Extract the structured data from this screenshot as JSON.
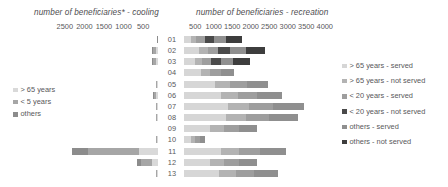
{
  "titles": {
    "cooling": "number of beneficiaries* - cooling",
    "recreation": "number of beneficiaries - recreation"
  },
  "axes": {
    "cooling_ticks": [
      "2500",
      "2000",
      "1500",
      "1000",
      "500"
    ],
    "recreation_ticks": [
      "500",
      "1000",
      "1500",
      "2000",
      "2500",
      "3000",
      "3500",
      "4000"
    ]
  },
  "legend_left": {
    "items": [
      {
        "label": "> 65 years",
        "color": "#d9d9d9"
      },
      {
        "label": "< 5 years",
        "color": "#a6a6a6"
      },
      {
        "label": "others",
        "color": "#8c8c8c"
      }
    ]
  },
  "legend_right": {
    "items": [
      {
        "label": "> 65 years - served",
        "color": "#d6d6d6"
      },
      {
        "label": "> 65 years - not served",
        "color": "#b3b3b3"
      },
      {
        "label": "< 20 years - served",
        "color": "#9e9e9e"
      },
      {
        "label": "< 20 years - not served",
        "color": "#4a4a4a"
      },
      {
        "label": "others - served",
        "color": "#8f8f8f"
      },
      {
        "label": "others - not served",
        "color": "#3d3d3d"
      }
    ]
  },
  "chart_data": {
    "type": "bar",
    "orientation": "horizontal-diverging",
    "categories": [
      "01",
      "02",
      "03",
      "04",
      "05",
      "06",
      "07",
      "08",
      "09",
      "10",
      "11",
      "12",
      "13"
    ],
    "left_panel": {
      "name": "cooling",
      "xlabel": "number of beneficiaries* - cooling",
      "xlim": [
        0,
        2750
      ],
      "direction": "right-to-left",
      "series": [
        {
          "name": "> 65 years",
          "color": "#d9d9d9",
          "values": [
            0,
            60,
            60,
            0,
            20,
            50,
            20,
            20,
            0,
            20,
            520,
            180,
            20
          ]
        },
        {
          "name": "< 5 years",
          "color": "#a6a6a6",
          "values": [
            0,
            90,
            90,
            0,
            25,
            60,
            25,
            25,
            0,
            25,
            1450,
            300,
            25
          ]
        },
        {
          "name": "others",
          "color": "#8c8c8c",
          "values": [
            20,
            30,
            30,
            0,
            10,
            25,
            10,
            10,
            0,
            10,
            430,
            110,
            10
          ]
        }
      ]
    },
    "right_panel": {
      "name": "recreation",
      "xlabel": "number of beneficiaries - recreation",
      "xlim": [
        0,
        4250
      ],
      "direction": "left-to-right",
      "series": [
        {
          "name": "> 65 years - served",
          "color": "#d6d6d6",
          "values": [
            200,
            420,
            310,
            500,
            900,
            1050,
            1250,
            1200,
            760,
            210,
            1050,
            760,
            1000
          ]
        },
        {
          "name": "> 65 years - not served",
          "color": "#b3b3b3",
          "values": [
            150,
            260,
            210,
            260,
            420,
            500,
            620,
            580,
            380,
            110,
            520,
            380,
            480
          ]
        },
        {
          "name": "< 20 years - served",
          "color": "#9e9e9e",
          "values": [
            240,
            300,
            250,
            310,
            480,
            560,
            700,
            660,
            430,
            130,
            600,
            430,
            540
          ]
        },
        {
          "name": "< 20 years - not served",
          "color": "#4a4a4a",
          "values": [
            280,
            330,
            290,
            0,
            0,
            0,
            0,
            0,
            0,
            0,
            0,
            0,
            0
          ]
        },
        {
          "name": "others - served",
          "color": "#8f8f8f",
          "values": [
            340,
            460,
            360,
            380,
            600,
            700,
            880,
            830,
            540,
            160,
            760,
            540,
            680
          ]
        },
        {
          "name": "others - not served",
          "color": "#3d3d3d",
          "values": [
            450,
            560,
            480,
            0,
            0,
            0,
            0,
            0,
            0,
            0,
            0,
            0,
            0
          ]
        }
      ]
    },
    "grid": false,
    "legend_position": [
      "left-middle",
      "right-middle"
    ]
  }
}
